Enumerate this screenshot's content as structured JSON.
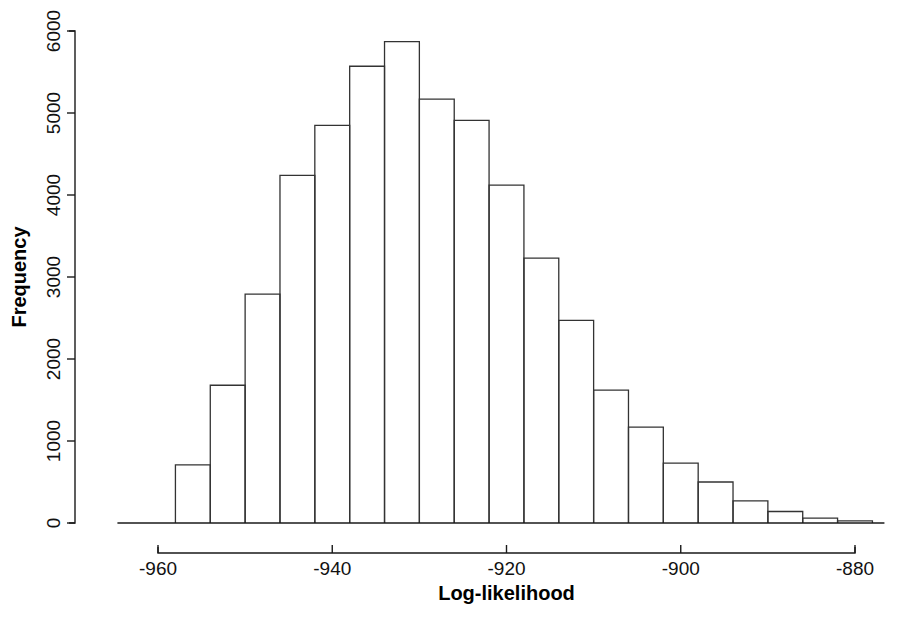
{
  "chart_data": {
    "type": "bar",
    "title": "",
    "subtitle": "",
    "xlabel": "Log-likelihood",
    "ylabel": "Frequency",
    "grid": false,
    "legend": false,
    "legend_position": "none",
    "xlim": [
      -962,
      -876
    ],
    "ylim": [
      0,
      6200
    ],
    "bin_width": 4,
    "x_ticks": [
      -960,
      -940,
      -920,
      -900,
      -880
    ],
    "x_tick_labels": [
      "-960",
      "-940",
      "-920",
      "-900",
      "-880"
    ],
    "y_ticks": [
      0,
      1000,
      2000,
      3000,
      4000,
      5000,
      6000
    ],
    "y_tick_labels": [
      "0",
      "1000",
      "2000",
      "3000",
      "4000",
      "5000",
      "6000"
    ],
    "bin_edges": [
      -958,
      -954,
      -950,
      -946,
      -942,
      -938,
      -934,
      -930,
      -926,
      -922,
      -918,
      -914,
      -910,
      -906,
      -902,
      -898,
      -894,
      -890,
      -886,
      -882,
      -878
    ],
    "bin_centers": [
      -956,
      -952,
      -948,
      -944,
      -940,
      -936,
      -932,
      -928,
      -924,
      -920,
      -916,
      -912,
      -908,
      -904,
      -900,
      -896,
      -892,
      -888,
      -884,
      -880
    ],
    "values": [
      710,
      1680,
      2790,
      4240,
      4850,
      5570,
      5870,
      5170,
      4910,
      4120,
      3230,
      2470,
      1620,
      1170,
      730,
      500,
      270,
      140,
      60,
      25
    ],
    "axis_color": "#1a1a1a",
    "bar_stroke_color": "#333333",
    "bar_fill_color": "none",
    "background_color": "#ffffff"
  },
  "plot": {
    "left_margin": 75,
    "right_margin": 880,
    "baseline_y": 523,
    "top_y": 31
  }
}
